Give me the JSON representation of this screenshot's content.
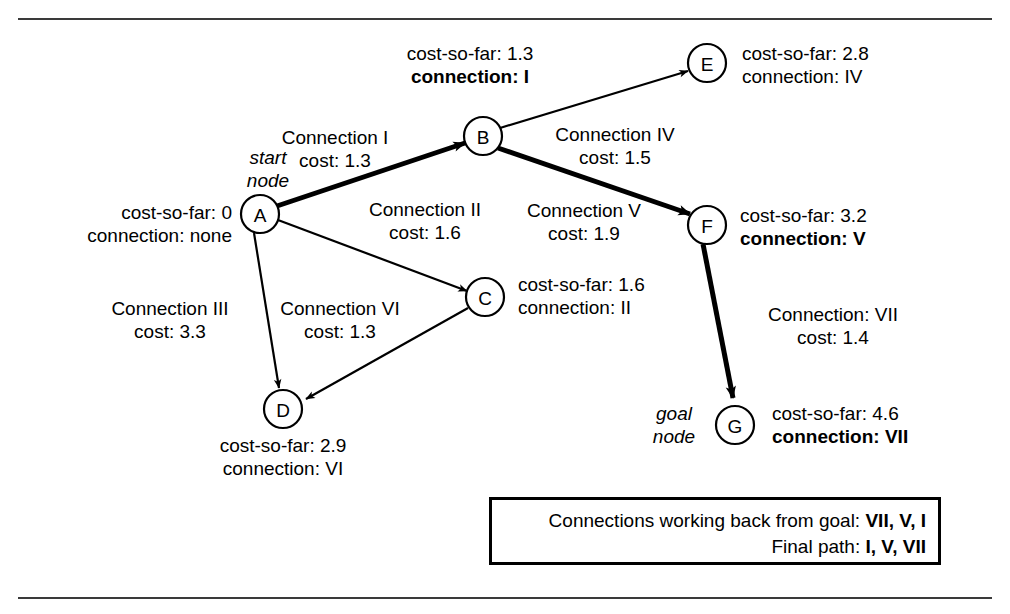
{
  "frame": {
    "top_rule": "horizontal-rule",
    "bottom_rule": "horizontal-rule"
  },
  "nodes": [
    {
      "id": "A",
      "label": "A",
      "cx": 260,
      "cy": 214,
      "r": 19,
      "role": "start node",
      "role_line1": "start",
      "role_line2": "node",
      "cost_so_far": "cost-so-far: 0",
      "connection": "connection: none",
      "connection_bold": false
    },
    {
      "id": "B",
      "label": "B",
      "cx": 483,
      "cy": 136,
      "r": 19,
      "role": "",
      "role_line1": "",
      "role_line2": "",
      "cost_so_far": "cost-so-far: 1.3",
      "connection": "connection: I",
      "connection_bold": true
    },
    {
      "id": "C",
      "label": "C",
      "cx": 485,
      "cy": 297,
      "r": 19,
      "role": "",
      "role_line1": "",
      "role_line2": "",
      "cost_so_far": "cost-so-far: 1.6",
      "connection": "connection: II",
      "connection_bold": false
    },
    {
      "id": "D",
      "label": "D",
      "cx": 283,
      "cy": 409,
      "r": 19,
      "role": "",
      "role_line1": "",
      "role_line2": "",
      "cost_so_far": "cost-so-far: 2.9",
      "connection": "connection: VI",
      "connection_bold": false
    },
    {
      "id": "E",
      "label": "E",
      "cx": 707,
      "cy": 63,
      "r": 19,
      "role": "",
      "role_line1": "",
      "role_line2": "",
      "cost_so_far": "cost-so-far: 2.8",
      "connection": "connection: IV",
      "connection_bold": false
    },
    {
      "id": "F",
      "label": "F",
      "cx": 707,
      "cy": 225,
      "r": 19,
      "role": "",
      "role_line1": "",
      "role_line2": "",
      "cost_so_far": "cost-so-far: 3.2",
      "connection": "connection: V",
      "connection_bold": true
    },
    {
      "id": "G",
      "label": "G",
      "cx": 735,
      "cy": 425,
      "r": 19,
      "role": "goal node",
      "role_line1": "goal",
      "role_line2": "node",
      "cost_so_far": "cost-so-far: 4.6",
      "connection": "connection: VII",
      "connection_bold": true
    }
  ],
  "edges": [
    {
      "id": "I",
      "from": "A",
      "to": "B",
      "name": "Connection I",
      "cost": "cost: 1.3",
      "on_path": true
    },
    {
      "id": "II",
      "from": "A",
      "to": "C",
      "name": "Connection II",
      "cost": "cost: 1.6",
      "on_path": false
    },
    {
      "id": "III",
      "from": "A",
      "to": "D",
      "name": "Connection III",
      "cost": "cost: 3.3",
      "on_path": false
    },
    {
      "id": "IV",
      "from": "B",
      "to": "E",
      "name": "Connection IV",
      "cost": "cost: 1.5",
      "on_path": false
    },
    {
      "id": "V",
      "from": "B",
      "to": "F",
      "name": "Connection V",
      "cost": "cost: 1.9",
      "on_path": true
    },
    {
      "id": "VI",
      "from": "C",
      "to": "D",
      "name": "Connection VI",
      "cost": "cost: 1.3",
      "on_path": false
    },
    {
      "id": "VII",
      "from": "F",
      "to": "G",
      "name": "Connection: VII",
      "cost": "cost: 1.4",
      "on_path": true
    }
  ],
  "labels": {
    "node_a_role_1": "start",
    "node_a_role_2": "node",
    "node_a_cost": "cost-so-far: 0",
    "node_a_conn": "connection: none",
    "node_b_cost": "cost-so-far: 1.3",
    "node_b_conn": "connection: I",
    "node_c_cost": "cost-so-far: 1.6",
    "node_c_conn": "connection: II",
    "node_d_cost": "cost-so-far: 2.9",
    "node_d_conn": "connection: VI",
    "node_e_cost": "cost-so-far: 2.8",
    "node_e_conn": "connection: IV",
    "node_f_cost": "cost-so-far: 3.2",
    "node_f_conn": "connection: V",
    "node_g_role_1": "goal",
    "node_g_role_2": "node",
    "node_g_cost": "cost-so-far: 4.6",
    "node_g_conn": "connection: VII",
    "edge_1_name": "Connection I",
    "edge_1_cost": "cost: 1.3",
    "edge_2_name": "Connection II",
    "edge_2_cost": "cost: 1.6",
    "edge_3_name": "Connection III",
    "edge_3_cost": "cost: 3.3",
    "edge_4_name": "Connection IV",
    "edge_4_cost": "cost: 1.5",
    "edge_5_name": "Connection V",
    "edge_5_cost": "cost: 1.9",
    "edge_6_name": "Connection VI",
    "edge_6_cost": "cost: 1.3",
    "edge_7_name": "Connection: VII",
    "edge_7_cost": "cost: 1.4",
    "node_a_letter": "A",
    "node_b_letter": "B",
    "node_c_letter": "C",
    "node_d_letter": "D",
    "node_e_letter": "E",
    "node_f_letter": "F",
    "node_g_letter": "G"
  },
  "summary_box": {
    "line1_prefix": "Connections working back from goal: ",
    "line1_value": "VII, V, I",
    "line2_prefix": "Final path: ",
    "line2_value": "I, V, VII"
  },
  "colors": {
    "ink": "#000000",
    "rule": "#3a3a3a",
    "background": "#ffffff"
  }
}
